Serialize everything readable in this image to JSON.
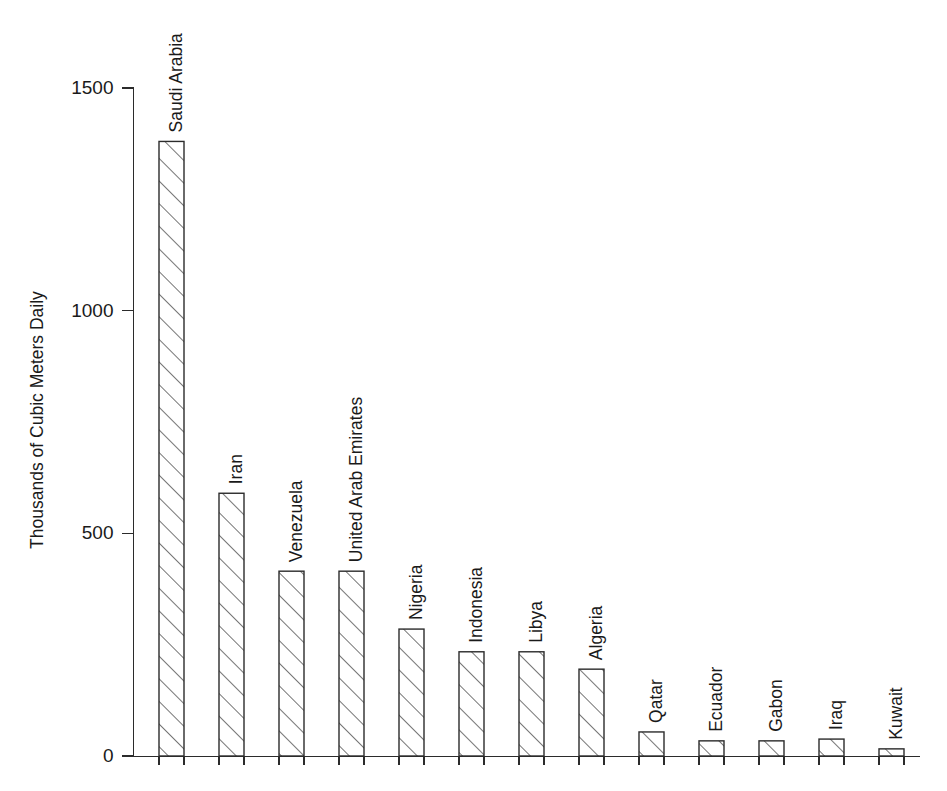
{
  "chart_data": {
    "type": "bar",
    "title": "",
    "subtitle": "",
    "xlabel": "",
    "ylabel": "Thousands of Cubic Meters Daily",
    "ylim": [
      0,
      1500
    ],
    "yticks": [
      0,
      500,
      1000,
      1500
    ],
    "ytick_labels": [
      "0",
      "500",
      "1000",
      "1500"
    ],
    "grid": false,
    "legend": null,
    "orientation": "vertical",
    "bar_style": "diagonal-hatch-outline",
    "categories": [
      "Saudi Arabia",
      "Iran",
      "Venezuela",
      "United Arab Emirates",
      "Nigeria",
      "Indonesia",
      "Libya",
      "Algeria",
      "Qatar",
      "Ecuador",
      "Gabon",
      "Iraq",
      "Kuwait"
    ],
    "values": [
      1380,
      590,
      415,
      415,
      285,
      234,
      234,
      195,
      54,
      34,
      34,
      38,
      16
    ],
    "annotations": []
  },
  "colors": {
    "background": "#ffffff",
    "ink": "#1a1a1a",
    "axis": "#2b2b2b",
    "bar_fill": "#ffffff",
    "bar_stroke": "#2b2b2b"
  }
}
